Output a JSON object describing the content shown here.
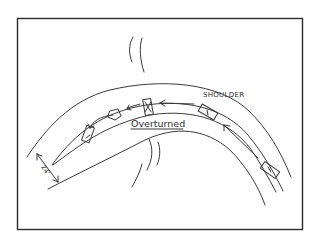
{
  "diagram": {
    "type": "accident-scene-sketch",
    "labels": {
      "shoulder": "SHOULDER",
      "overturned": "Overturned",
      "road_width": "24'"
    },
    "elements": {
      "vehicles": [
        {
          "id": "vehicle-approaching-lower-right",
          "state": "traveling"
        },
        {
          "id": "vehicle-on-shoulder",
          "state": "traveling"
        },
        {
          "id": "vehicle-overturned",
          "state": "overturned",
          "marker": "X"
        },
        {
          "id": "vehicle-rolling",
          "state": "rolling"
        },
        {
          "id": "vehicle-final-rest-left",
          "state": "at-rest"
        }
      ],
      "paths": [
        {
          "id": "path-approach",
          "direction": "right-to-left"
        },
        {
          "id": "path-shoulder-travel",
          "direction": "right-to-left"
        },
        {
          "id": "path-roll-trajectory",
          "direction": "right-to-left"
        }
      ],
      "road_edges": [
        "outer-edge",
        "center-line",
        "inner-edge",
        "shoulder-edge"
      ],
      "marks": [
        "top-skid-marks",
        "bottom-skid-marks"
      ],
      "dimension": {
        "label": "24'",
        "meaning": "road width"
      }
    },
    "colors": {
      "ink": "#3a3a3a",
      "background": "#ffffff",
      "frame": "#2b2b2b"
    }
  }
}
